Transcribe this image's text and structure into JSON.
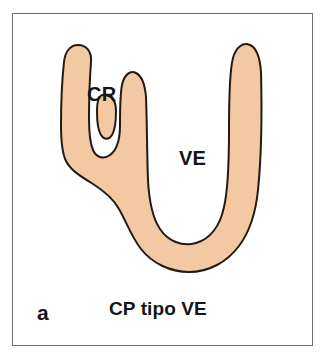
{
  "figure": {
    "panel_letter": "a",
    "caption": "CP tipo VE",
    "annotations": [
      {
        "id": "cr",
        "label": "CR"
      },
      {
        "id": "ve",
        "label": "VE"
      }
    ],
    "colors": {
      "background": "#ffffff",
      "frame_border": "#6f6f6f",
      "organ_fill": "#f2c9a3",
      "organ_outline": "#231a14",
      "text": "#151515"
    },
    "shape": {
      "name": "bicornuate-uterus-outline",
      "description": "Y/U shaped organ silhouette with a left horn, a central horn forming the CR notch, and a long right limb forming the VE cavity"
    }
  }
}
